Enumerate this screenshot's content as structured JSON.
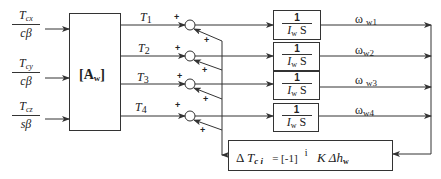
{
  "diagram": {
    "inputs": [
      {
        "num": "T",
        "num_sub": "cx",
        "den": "cβ"
      },
      {
        "num": "T",
        "num_sub": "cy",
        "den": "cβ"
      },
      {
        "num": "T",
        "num_sub": "cz",
        "den": "sβ"
      }
    ],
    "matrix_block": {
      "label": "[A",
      "label_sub": "w",
      "label_close": "]"
    },
    "torques": [
      {
        "label": "T",
        "sub": "1"
      },
      {
        "label": "T",
        "sub": "2"
      },
      {
        "label": "T",
        "sub": "3"
      },
      {
        "label": "T",
        "sub": "4"
      }
    ],
    "summing_signs": "+",
    "transfer_blocks": [
      {
        "num": "1",
        "den": "I",
        "den_sub": "w",
        "den_s": "S"
      },
      {
        "num": "1",
        "den": "I",
        "den_sub": "w",
        "den_s": "S"
      },
      {
        "num": "1",
        "den": "I",
        "den_sub": "w",
        "den_s": "S"
      },
      {
        "num": "1",
        "den": "I",
        "den_sub": "w",
        "den_s": "S"
      }
    ],
    "outputs": [
      {
        "label": "ω",
        "sub": "w1"
      },
      {
        "label": "ω",
        "sub": "w2"
      },
      {
        "label": "ω",
        "sub": "w3"
      },
      {
        "label": "ω",
        "sub": "w4"
      }
    ],
    "feedback_block": {
      "delta": "Δ",
      "T": "T",
      "T_sub": "c i",
      "eq": "= [-1]",
      "exp": "i",
      "K": "K",
      "dh": "Δh",
      "dh_sub": "w"
    },
    "colors": {
      "line": "#333333",
      "background": "#ffffff"
    }
  }
}
